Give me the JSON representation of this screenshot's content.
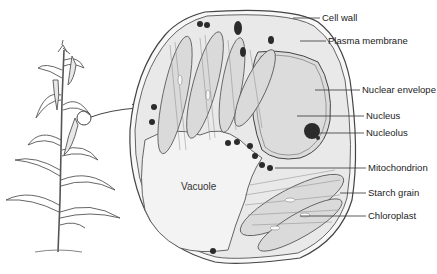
{
  "diagram": {
    "vacuole_label": "Vacuole",
    "labels": [
      {
        "text": "Cell wall",
        "x": 322,
        "y": 18
      },
      {
        "text": "Plasma membrane",
        "x": 328,
        "y": 42
      },
      {
        "text": "Nuclear envelope",
        "x": 362,
        "y": 90
      },
      {
        "text": "Nucleus",
        "x": 366,
        "y": 116
      },
      {
        "text": "Nucleolus",
        "x": 366,
        "y": 133
      },
      {
        "text": "Mitochondrion",
        "x": 368,
        "y": 168
      },
      {
        "text": "Starch grain",
        "x": 368,
        "y": 193
      },
      {
        "text": "Chloroplast",
        "x": 368,
        "y": 216
      }
    ],
    "colors": {
      "line": "#444444",
      "cytoplasm": "#e9e9e9",
      "vacuole": "#f2f2f2",
      "nucleus": "#dcdcdc",
      "organelle_dark": "#2b2b2b"
    }
  }
}
